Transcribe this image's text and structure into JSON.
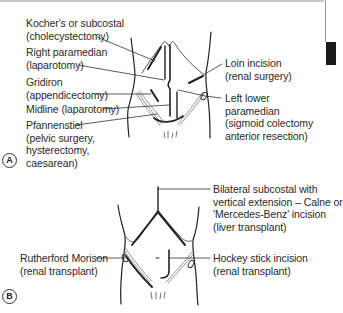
{
  "figure": {
    "panels": [
      {
        "badge": "A",
        "labels": {
          "kocher": "Kocher's or subcostal\n(cholecystectomy)",
          "right_paramedian": "Right paramedian\n(laparotomy)",
          "gridiron": "Gridiron\n(appendicectomy)",
          "midline": "Midline (laparotomy)",
          "pfannenstiel": "Pfannenstiel\n(pelvic surgery,\nhysterectomy,\ncaesarean)",
          "loin": "Loin incision\n(renal surgery)",
          "left_lower_paramedian": "Left lower\nparamedian\n(sigmoid colectomy\nanterior resection)"
        }
      },
      {
        "badge": "B",
        "labels": {
          "bilateral_subcostal": "Bilateral subcostal with\nvertical extension – Calne or\n'Mercedes-Benz' incision\n(liver transplant)",
          "rutherford_morison": "Rutherford Morison\n(renal transplant)",
          "hockey_stick": "Hockey stick incision\n(renal transplant)"
        }
      }
    ]
  },
  "colors": {
    "line": "#222222",
    "thin_line": "#555555",
    "text": "#2a2a2a",
    "tab": "#1a1a1a"
  }
}
